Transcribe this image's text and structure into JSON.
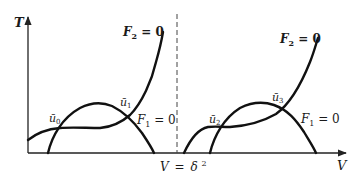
{
  "diagram": {
    "axes": {
      "y_label": "T",
      "x_label": "V",
      "divider_label_var": "V",
      "divider_label_eq": "=",
      "divider_label_val": "δ",
      "divider_label_exp": "2"
    },
    "left_panel": {
      "f2_label_var": "F",
      "f2_label_sub": "2",
      "f2_label_rest": " = 0",
      "f1_label_var": "F",
      "f1_label_sub": "1",
      "f1_label_rest": " = 0",
      "points": [
        {
          "name": "ū",
          "sub": "0"
        },
        {
          "name": "ū",
          "sub": "1"
        }
      ]
    },
    "right_panel": {
      "f2_label_var": "F",
      "f2_label_sub": "2",
      "f2_label_rest": " = 0",
      "f1_label_var": "F",
      "f1_label_sub": "1",
      "f1_label_rest": " = 0",
      "points": [
        {
          "name": "ū",
          "sub": "2"
        },
        {
          "name": "ū",
          "sub": "3"
        }
      ]
    },
    "colors": {
      "ink": "#111111",
      "background": "#ffffff"
    }
  }
}
